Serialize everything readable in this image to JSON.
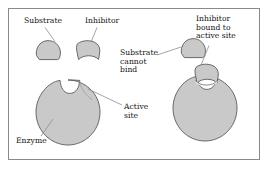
{
  "diagram": {
    "labels": {
      "substrate": "Substrate",
      "inhibitor": "Inhibitor",
      "substrate_cannot_bind": "Substrate\ncannot\nbind",
      "inhibitor_bound": "Inhibitor\nbound to\nactive site",
      "active_site": "Active\nsite",
      "enzyme": "Enzyme"
    },
    "colors": {
      "shape_fill": "#c9c9c9",
      "shape_stroke": "#5a5a5a",
      "leader_line": "#8d8d8d",
      "frame_border": "#8a8a8a",
      "text": "#111111",
      "background": "#ffffff"
    },
    "shapes": [
      {
        "name": "substrate-left",
        "type": "dome-blob",
        "cx": 48,
        "cy": 49
      },
      {
        "name": "inhibitor-left",
        "type": "wedge-notch",
        "cx": 88,
        "cy": 50
      },
      {
        "name": "enzyme-left",
        "type": "circle-notch",
        "cx": 68,
        "cy": 112,
        "r": 32
      },
      {
        "name": "substrate-right",
        "type": "dome-blob",
        "cx": 192,
        "cy": 48
      },
      {
        "name": "enzyme-right",
        "type": "circle-notch",
        "cx": 205,
        "cy": 108,
        "r": 32
      },
      {
        "name": "inhibitor-bound",
        "type": "wedge-notch",
        "cx": 205,
        "cy": 75
      }
    ],
    "leader_lines": [
      {
        "name": "leader-substrate",
        "from": [
          44,
          27
        ],
        "to": [
          54,
          41
        ]
      },
      {
        "name": "leader-inhibitor",
        "from": [
          96,
          27
        ],
        "to": [
          91,
          41
        ]
      },
      {
        "name": "leader-cannot-bind",
        "from": [
          157,
          54
        ],
        "to": [
          181,
          48
        ]
      },
      {
        "name": "leader-inh-bound",
        "from": [
          208,
          45
        ],
        "to": [
          199,
          70
        ]
      },
      {
        "name": "leader-active-site",
        "from": [
          122,
          105
        ],
        "to": [
          87,
          89
        ]
      },
      {
        "name": "leader-enzyme",
        "from": [
          40,
          136
        ],
        "to": [
          52,
          119
        ]
      }
    ]
  }
}
